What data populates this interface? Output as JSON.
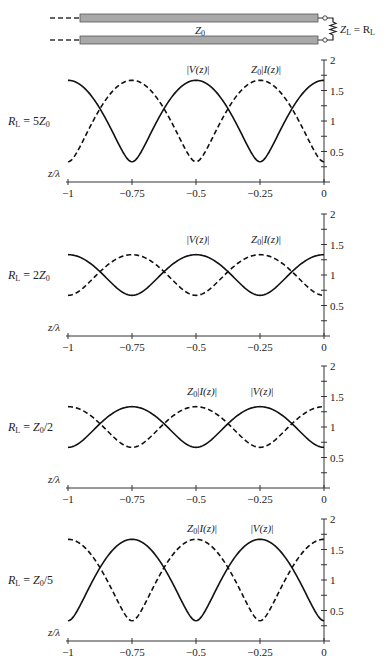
{
  "diagram": {
    "line_label": "Z",
    "line_label_sub": "0",
    "load_label": "Z",
    "load_label_sub": "L",
    "load_eq": " = R",
    "load_eq_sub": "L",
    "colors": {
      "conductor_fill": "#a8a8a8",
      "conductor_stroke": "#555555",
      "ink": "#222222"
    }
  },
  "chart_data": [
    {
      "type": "line",
      "title": "R_L = 5Z_0",
      "row_label": {
        "main": "R",
        "sub": "L",
        "rest": " = 5Z",
        "sub2": "0"
      },
      "gamma": 0.6667,
      "xlabel": "z/λ",
      "xticks": [
        -1,
        -0.75,
        -0.5,
        -0.25,
        0
      ],
      "xtick_labels": [
        "−1",
        "−0.75",
        "−0.5",
        "−0.25",
        "0"
      ],
      "yticks": [
        0.5,
        1,
        1.5,
        2
      ],
      "ytick_labels": [
        "0.5",
        "1",
        "1.5",
        "2"
      ],
      "ylim": [
        0,
        2
      ],
      "xlim": [
        -1,
        0
      ],
      "x": [
        -1,
        -0.875,
        -0.75,
        -0.625,
        -0.5,
        -0.375,
        -0.25,
        -0.125,
        0
      ],
      "series": [
        {
          "name": "|V(z)|",
          "style": "solid",
          "values": [
            1.667,
            1.202,
            0.333,
            1.202,
            1.667,
            1.202,
            0.333,
            1.202,
            1.667
          ]
        },
        {
          "name": "Z0|I(z)|",
          "style": "dashed",
          "values": [
            0.333,
            1.202,
            1.667,
            1.202,
            0.333,
            1.202,
            1.667,
            1.202,
            0.333
          ]
        }
      ],
      "annotations": [
        {
          "text": "|V(z)|",
          "x": -0.5,
          "y": 1.85
        },
        {
          "text": "Z0|I(z)|",
          "x": -0.25,
          "y": 1.85
        }
      ]
    },
    {
      "type": "line",
      "title": "R_L = 2Z_0",
      "row_label": {
        "main": "R",
        "sub": "L",
        "rest": " = 2Z",
        "sub2": "0"
      },
      "gamma": 0.3333,
      "xlabel": "z/λ",
      "xticks": [
        -1,
        -0.75,
        -0.5,
        -0.25,
        0
      ],
      "xtick_labels": [
        "−1",
        "−0.75",
        "−0.5",
        "−0.25",
        "0"
      ],
      "yticks": [
        0.5,
        1,
        1.5,
        2
      ],
      "ytick_labels": [
        "0.5",
        "1",
        "1.5",
        "2"
      ],
      "ylim": [
        0,
        2
      ],
      "xlim": [
        -1,
        0
      ],
      "x": [
        -1,
        -0.875,
        -0.75,
        -0.625,
        -0.5,
        -0.375,
        -0.25,
        -0.125,
        0
      ],
      "series": [
        {
          "name": "|V(z)|",
          "style": "solid",
          "values": [
            1.333,
            1.054,
            0.667,
            1.054,
            1.333,
            1.054,
            0.667,
            1.054,
            1.333
          ]
        },
        {
          "name": "Z0|I(z)|",
          "style": "dashed",
          "values": [
            0.667,
            1.054,
            1.333,
            1.054,
            0.667,
            1.054,
            1.333,
            1.054,
            0.667
          ]
        }
      ],
      "annotations": [
        {
          "text": "|V(z)|",
          "x": -0.5,
          "y": 1.5
        },
        {
          "text": "Z0|I(z)|",
          "x": -0.25,
          "y": 1.5
        }
      ]
    },
    {
      "type": "line",
      "title": "R_L = Z_0/2",
      "row_label": {
        "main": "R",
        "sub": "L",
        "rest": " = Z",
        "sub2": "0",
        "rest2": "/2"
      },
      "gamma": -0.3333,
      "xlabel": "z/λ",
      "xticks": [
        -1,
        -0.75,
        -0.5,
        -0.25,
        0
      ],
      "xtick_labels": [
        "−1",
        "−0.75",
        "−0.5",
        "−0.25",
        "0"
      ],
      "yticks": [
        0.5,
        1,
        1.5,
        2
      ],
      "ytick_labels": [
        "0.5",
        "1",
        "1.5",
        "2"
      ],
      "ylim": [
        0,
        2
      ],
      "xlim": [
        -1,
        0
      ],
      "x": [
        -1,
        -0.875,
        -0.75,
        -0.625,
        -0.5,
        -0.375,
        -0.25,
        -0.125,
        0
      ],
      "series": [
        {
          "name": "|V(z)|",
          "style": "solid",
          "values": [
            0.667,
            1.054,
            1.333,
            1.054,
            0.667,
            1.054,
            1.333,
            1.054,
            0.667
          ]
        },
        {
          "name": "Z0|I(z)|",
          "style": "dashed",
          "values": [
            1.333,
            1.054,
            0.667,
            1.054,
            1.333,
            1.054,
            0.667,
            1.054,
            1.333
          ]
        }
      ],
      "annotations": [
        {
          "text": "Z0|I(z)|",
          "x": -0.5,
          "y": 1.5
        },
        {
          "text": "|V(z)|",
          "x": -0.25,
          "y": 1.5
        }
      ]
    },
    {
      "type": "line",
      "title": "R_L = Z_0/5",
      "row_label": {
        "main": "R",
        "sub": "L",
        "rest": " = Z",
        "sub2": "0",
        "rest2": "/5"
      },
      "gamma": -0.6667,
      "xlabel": "z/λ",
      "xticks": [
        -1,
        -0.75,
        -0.5,
        -0.25,
        0
      ],
      "xtick_labels": [
        "−1",
        "−0.75",
        "−0.5",
        "−0.25",
        "0"
      ],
      "yticks": [
        0.5,
        1,
        1.5,
        2
      ],
      "ytick_labels": [
        "0.5",
        "1",
        "1.5",
        "2"
      ],
      "ylim": [
        0,
        2
      ],
      "xlim": [
        -1,
        0
      ],
      "x": [
        -1,
        -0.875,
        -0.75,
        -0.625,
        -0.5,
        -0.375,
        -0.25,
        -0.125,
        0
      ],
      "series": [
        {
          "name": "|V(z)|",
          "style": "solid",
          "values": [
            0.333,
            1.202,
            1.667,
            1.202,
            0.333,
            1.202,
            1.667,
            1.202,
            0.333
          ]
        },
        {
          "name": "Z0|I(z)|",
          "style": "dashed",
          "values": [
            1.667,
            1.202,
            0.333,
            1.202,
            1.667,
            1.202,
            0.333,
            1.202,
            1.667
          ]
        }
      ],
      "annotations": [
        {
          "text": "Z0|I(z)|",
          "x": -0.5,
          "y": 1.85
        },
        {
          "text": "|V(z)|",
          "x": -0.25,
          "y": 1.85
        }
      ]
    }
  ]
}
